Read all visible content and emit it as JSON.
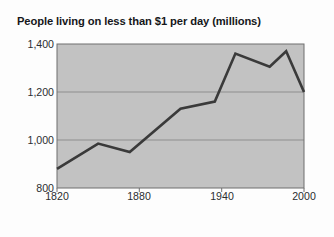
{
  "chart_data": {
    "type": "line",
    "title": "People living on less than $1 per day (millions)",
    "xlabel": "",
    "ylabel": "",
    "xlim": [
      1820,
      2000
    ],
    "ylim": [
      800,
      1400
    ],
    "xticks": [
      "1820",
      "1880",
      "1940",
      "2000"
    ],
    "xtick_values": [
      1820,
      1880,
      1940,
      2000
    ],
    "yticks": [
      "800",
      "1,000",
      "1,200",
      "1,400"
    ],
    "ytick_values": [
      800,
      1000,
      1200,
      1400
    ],
    "grid": "horizontal gridlines at 1,000 and 1,200",
    "legend": "none",
    "series": [
      {
        "name": "People living on less than $1 per day (millions)",
        "x": [
          1820,
          1850,
          1873,
          1910,
          1935,
          1950,
          1975,
          1987,
          2000
        ],
        "values": [
          880,
          985,
          950,
          1130,
          1160,
          1360,
          1305,
          1370,
          1200
        ]
      }
    ],
    "colors": {
      "line": "#3a3a3a",
      "plot_background": "#c2c2c2",
      "gridline": "#8e8e8e",
      "axis": "#6f6f6f",
      "figure_background": "#fdfdfd",
      "text": "#2b2e31"
    }
  }
}
